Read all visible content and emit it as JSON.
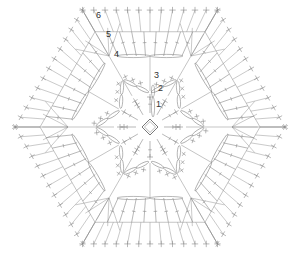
{
  "diagram": {
    "title": "",
    "type": "crochet-hexagon-chart",
    "center": [
      150,
      127
    ],
    "colors": {
      "stroke": "#888888",
      "dark": "#555555",
      "label": "#333333",
      "background": "#ffffff"
    },
    "round_labels": [
      {
        "text": "1",
        "x": 156,
        "y": 107
      },
      {
        "text": "2",
        "x": 158,
        "y": 91
      },
      {
        "text": "3",
        "x": 154,
        "y": 78
      },
      {
        "text": "4",
        "x": 114,
        "y": 57
      },
      {
        "text": "5",
        "x": 106,
        "y": 37
      },
      {
        "text": "6",
        "x": 96,
        "y": 18
      }
    ],
    "rounds": {
      "r1_radius": 8,
      "r2_inner": 14,
      "r2_outer": 30,
      "r3_star_inner": 22,
      "r3_star_outer": 55,
      "r4_radius": 82,
      "r5_radius": 110,
      "r6_radius": 135
    }
  }
}
